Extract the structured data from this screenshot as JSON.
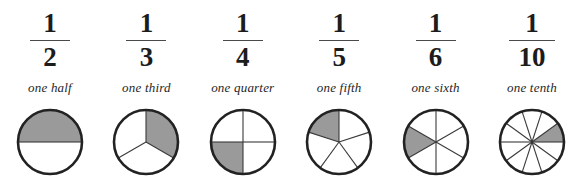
{
  "figure": {
    "bleed_text": "..  ..   ..    ..     ..      ..",
    "colors": {
      "shade": "#9a9a9a",
      "outline": "#222222",
      "spoke": "#3a3a3a",
      "text": "#1c1c1c",
      "background": "#ffffff"
    },
    "geometry": {
      "circle_diameter": 64,
      "outline_width": 2.6,
      "spoke_width": 1.1
    }
  },
  "chart_data": {
    "type": "pie",
    "xlabel": "",
    "ylabel": "",
    "legend": "none",
    "grid": false,
    "columns": [
      {
        "numerator": "1",
        "denominator": "2",
        "label": "one half",
        "value": 0.5,
        "slices": 2,
        "shaded_slices": 1,
        "shaded_fraction": 0.5,
        "start_angle": 0,
        "shaded_index": 1,
        "bar_width": "narrow"
      },
      {
        "numerator": "1",
        "denominator": "3",
        "label": "one third",
        "value": 0.3333,
        "slices": 3,
        "shaded_slices": 1,
        "shaded_fraction": 0.3333,
        "start_angle": 90,
        "shaded_index": 0,
        "bar_width": "narrow"
      },
      {
        "numerator": "1",
        "denominator": "4",
        "label": "one quarter",
        "value": 0.25,
        "slices": 4,
        "shaded_slices": 1,
        "shaded_fraction": 0.25,
        "start_angle": 90,
        "shaded_index": 2,
        "bar_width": "narrow"
      },
      {
        "numerator": "1",
        "denominator": "5",
        "label": "one fifth",
        "value": 0.2,
        "slices": 5,
        "shaded_slices": 1,
        "shaded_fraction": 0.2,
        "start_angle": 90,
        "shaded_index": 4,
        "bar_width": "narrow"
      },
      {
        "numerator": "1",
        "denominator": "6",
        "label": "one sixth",
        "value": 0.1667,
        "slices": 6,
        "shaded_slices": 1,
        "shaded_fraction": 0.1667,
        "start_angle": 90,
        "shaded_index": 4,
        "bar_width": "narrow"
      },
      {
        "numerator": "1",
        "denominator": "10",
        "label": "one tenth",
        "value": 0.1,
        "slices": 10,
        "shaded_slices": 1,
        "shaded_fraction": 0.1,
        "start_angle": 0,
        "shaded_index": 9,
        "bar_width": "wide"
      }
    ]
  }
}
